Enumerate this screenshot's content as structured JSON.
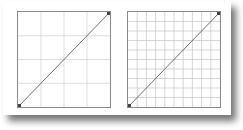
{
  "figure": {
    "background_color": "#ffffff",
    "card_color": "#ffffff",
    "shadow_color": "#000000"
  },
  "chart_data": [
    {
      "id": "left-plot",
      "type": "line",
      "title": "",
      "subtitle": "",
      "xlabel": "",
      "ylabel": "",
      "x": [
        0,
        1
      ],
      "y": [
        0,
        1
      ],
      "series": [
        {
          "name": "identity-line",
          "values": [
            0,
            1
          ]
        }
      ],
      "xlim": [
        0,
        1
      ],
      "ylim": [
        0,
        1
      ],
      "xticks": [
        0,
        0.25,
        0.5,
        0.75,
        1
      ],
      "yticks": [
        0,
        0.25,
        0.5,
        0.75,
        1
      ],
      "xticklabels": [
        "",
        "",
        "",
        "",
        ""
      ],
      "yticklabels": [
        "",
        "",
        "",
        "",
        ""
      ],
      "grid": true,
      "grid_divisions_x": 4,
      "grid_divisions_y": 4,
      "grid_color": "#d0d0d0",
      "line_color": "#6e6e6e",
      "line_width": 1,
      "marker": "square",
      "marker_color": "#404040",
      "marker_points": [
        [
          0,
          0
        ],
        [
          1,
          1
        ]
      ],
      "legend": null,
      "annotations": []
    },
    {
      "id": "right-plot",
      "type": "line",
      "title": "",
      "subtitle": "",
      "xlabel": "",
      "ylabel": "",
      "x": [
        0,
        1
      ],
      "y": [
        0,
        1
      ],
      "series": [
        {
          "name": "identity-line",
          "values": [
            0,
            1
          ]
        }
      ],
      "xlim": [
        0,
        1
      ],
      "ylim": [
        0,
        1
      ],
      "xticks": [
        0,
        0.1,
        0.2,
        0.3,
        0.4,
        0.5,
        0.6,
        0.7,
        0.8,
        0.9,
        1
      ],
      "yticks": [
        0,
        0.1,
        0.2,
        0.3,
        0.4,
        0.5,
        0.6,
        0.7,
        0.8,
        0.9,
        1
      ],
      "xticklabels": [
        "",
        "",
        "",
        "",
        "",
        "",
        "",
        "",
        "",
        "",
        ""
      ],
      "yticklabels": [
        "",
        "",
        "",
        "",
        "",
        "",
        "",
        "",
        "",
        "",
        ""
      ],
      "grid": true,
      "grid_divisions_x": 10,
      "grid_divisions_y": 10,
      "grid_color": "#c4c4c4",
      "line_color": "#6e6e6e",
      "line_width": 1,
      "marker": "square",
      "marker_color": "#404040",
      "marker_points": [
        [
          0,
          0
        ],
        [
          1,
          1
        ]
      ],
      "legend": null,
      "annotations": []
    }
  ]
}
